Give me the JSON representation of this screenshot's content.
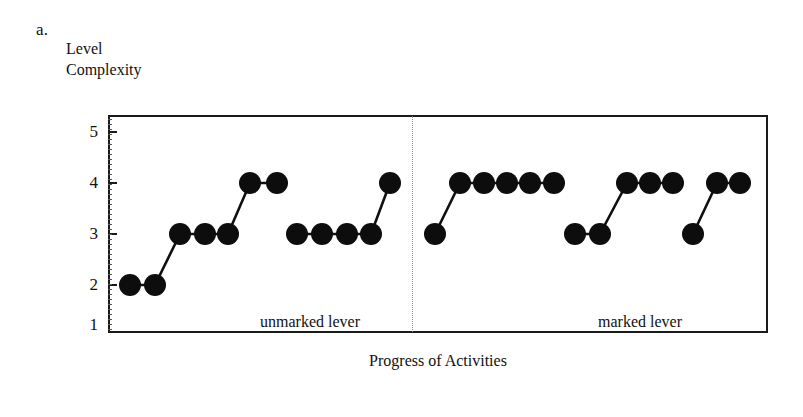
{
  "figure": {
    "panel_label": "a.",
    "y_axis_title_line1": "Level",
    "y_axis_title_line2": "Complexity",
    "x_axis_title": "Progress of Activities",
    "group_label_left": "unmarked lever",
    "group_label_right": "marked lever",
    "marker_color": "#0d0d0d",
    "line_color": "#101010",
    "frame_color": "#1a1a1a",
    "divider_color": "#8c8c8c"
  },
  "chart_data": {
    "type": "line",
    "title": "",
    "subtitle": "",
    "xlabel": "Progress of Activities",
    "ylabel": "Level Complexity",
    "ylim": [
      1,
      5
    ],
    "yticks": [
      1,
      2,
      3,
      4,
      5
    ],
    "ytick_labels": [
      "1",
      "2",
      "3",
      "4",
      "5"
    ],
    "xticks": [],
    "xtick_labels": [],
    "grid": false,
    "legend": "none",
    "annotations": [
      "a.",
      "unmarked lever",
      "marked lever"
    ],
    "conditions": [
      {
        "name": "unmarked lever",
        "divider_after": true,
        "segments": [
          {
            "x": [
              1,
              2,
              3,
              4,
              5,
              6,
              7
            ],
            "y": [
              2,
              2,
              3,
              3,
              3,
              4,
              4
            ]
          },
          {
            "x": [
              9,
              10,
              11,
              12,
              13
            ],
            "y": [
              3,
              3,
              3,
              3,
              4
            ]
          }
        ]
      },
      {
        "name": "marked lever",
        "divider_after": false,
        "segments": [
          {
            "x": [
              15,
              16,
              17,
              18,
              19,
              20
            ],
            "y": [
              3,
              4,
              4,
              4,
              4,
              4
            ]
          },
          {
            "x": [
              22,
              23,
              24,
              25,
              26
            ],
            "y": [
              3,
              3,
              4,
              4,
              4
            ]
          },
          {
            "x": [
              28,
              29,
              30
            ],
            "y": [
              3,
              4,
              4
            ]
          }
        ]
      }
    ],
    "series": [
      {
        "name": "unmarked lever segment 1",
        "values": [
          2,
          2,
          3,
          3,
          3,
          4,
          4
        ]
      },
      {
        "name": "unmarked lever segment 2",
        "values": [
          3,
          3,
          3,
          3,
          4
        ]
      },
      {
        "name": "marked lever segment 1",
        "values": [
          3,
          4,
          4,
          4,
          4,
          4
        ]
      },
      {
        "name": "marked lever segment 2",
        "values": [
          3,
          3,
          4,
          4,
          4
        ]
      },
      {
        "name": "marked lever segment 3",
        "values": [
          3,
          4,
          4
        ]
      }
    ],
    "pixel_layout": {
      "frame": {
        "left": 108,
        "top": 115,
        "right": 768,
        "bottom": 333
      },
      "y_pixels": {
        "1": 325,
        "2": 285,
        "3": 234,
        "4": 183,
        "5": 132
      },
      "divider_x": 412,
      "marker_radius": 11,
      "segments_px": [
        {
          "points": [
            [
              130,
              285
            ],
            [
              155,
              285
            ],
            [
              180,
              234
            ],
            [
              205,
              234
            ],
            [
              228,
              234
            ],
            [
              250,
              183
            ],
            [
              277,
              183
            ]
          ]
        },
        {
          "points": [
            [
              297,
              234
            ],
            [
              322,
              234
            ],
            [
              347,
              234
            ],
            [
              371,
              234
            ],
            [
              390,
              183
            ]
          ]
        },
        {
          "points": [
            [
              435,
              234
            ],
            [
              460,
              183
            ],
            [
              484,
              183
            ],
            [
              507,
              183
            ],
            [
              530,
              183
            ],
            [
              554,
              183
            ]
          ]
        },
        {
          "points": [
            [
              575,
              234
            ],
            [
              600,
              234
            ],
            [
              627,
              183
            ],
            [
              650,
              183
            ],
            [
              673,
              183
            ]
          ]
        },
        {
          "points": [
            [
              693,
              234
            ],
            [
              717,
              183
            ],
            [
              740,
              183
            ]
          ]
        }
      ],
      "group_label_left_x": 310,
      "group_label_right_x": 640,
      "group_label_y": 313
    }
  }
}
